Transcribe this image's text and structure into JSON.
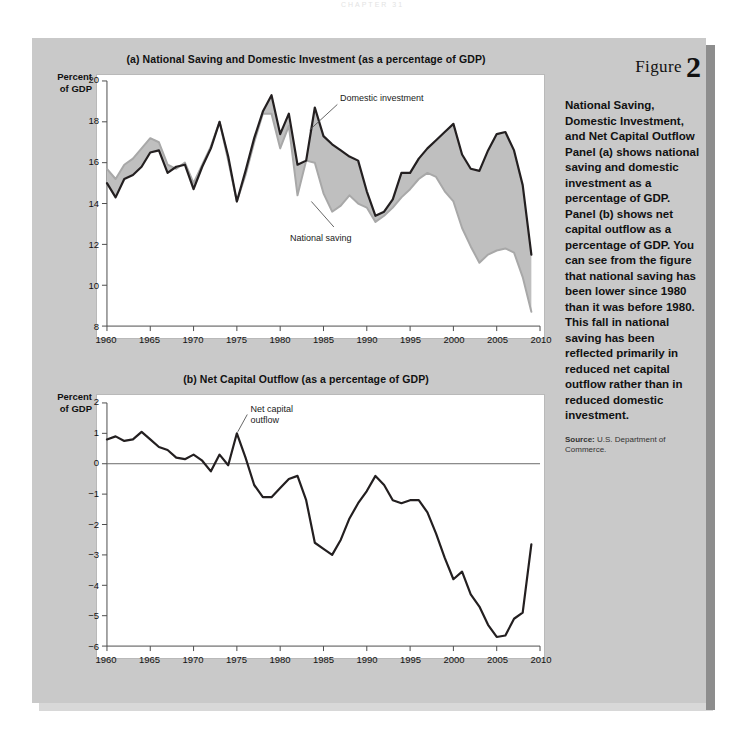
{
  "page_header": "CHAPTER 31",
  "figure": {
    "word": "Figure",
    "number": "2",
    "title": "National Saving, Domestic Investment, and Net Capital Outflow",
    "body": "Panel (a) shows national saving and domestic investment as a percentage of GDP. Panel (b) shows net capital outflow as a percentage of GDP. You can see from the figure that national saving has been lower since 1980 than it was before 1980. This fall in national saving has been reflected primarily in reduced net capital outflow rather than in reduced domestic investment.",
    "source_label": "Source:",
    "source_text": " U.S. Department of Commerce."
  },
  "colors": {
    "page_background": "#ffffff",
    "panel_background": "#c9c9c9",
    "plot_background": "#ffffff",
    "dark_line": "#231f20",
    "gray_line": "#a8a8a8",
    "shaded_area": "#bfbfbf",
    "axis": "#4d4d4d",
    "text": "#111111"
  },
  "chart_data": [
    {
      "type": "line",
      "id": "panel-a",
      "title": "(a) National Saving and Domestic Investment (as a percentage of GDP)",
      "xlabel": "",
      "ylabel": "Percent of GDP",
      "ylabel_lines": [
        "Percent",
        "of GDP"
      ],
      "xlim": [
        1960,
        2010
      ],
      "ylim": [
        8,
        20
      ],
      "yticks": [
        8,
        10,
        12,
        14,
        16,
        18,
        20
      ],
      "xticks": [
        1960,
        1965,
        1970,
        1975,
        1980,
        1985,
        1990,
        1995,
        2000,
        2005,
        2010
      ],
      "grid": false,
      "legend": "inline-annotations",
      "annotations": [
        {
          "text": "Domestic investment",
          "x": 1986,
          "y": 19.2
        },
        {
          "text": "National saving",
          "x": 1984.5,
          "y": 12.4
        }
      ],
      "x": [
        1960,
        1961,
        1962,
        1963,
        1964,
        1965,
        1966,
        1967,
        1968,
        1969,
        1970,
        1971,
        1972,
        1973,
        1974,
        1975,
        1976,
        1977,
        1978,
        1979,
        1980,
        1981,
        1982,
        1983,
        1984,
        1985,
        1986,
        1987,
        1988,
        1989,
        1990,
        1991,
        1992,
        1993,
        1994,
        1995,
        1996,
        1997,
        1998,
        1999,
        2000,
        2001,
        2002,
        2003,
        2004,
        2005,
        2006,
        2007,
        2008,
        2009
      ],
      "series": [
        {
          "name": "Domestic investment",
          "color": "#231f20",
          "values": [
            15.0,
            14.3,
            15.2,
            15.4,
            15.8,
            16.5,
            16.6,
            15.5,
            15.8,
            15.9,
            14.7,
            15.8,
            16.7,
            18.0,
            16.3,
            14.1,
            15.6,
            17.2,
            18.5,
            19.3,
            17.4,
            18.4,
            15.9,
            16.1,
            18.7,
            17.3,
            16.9,
            16.6,
            16.3,
            16.1,
            14.6,
            13.4,
            13.6,
            14.2,
            15.5,
            15.5,
            16.2,
            16.7,
            17.1,
            17.5,
            17.9,
            16.4,
            15.7,
            15.6,
            16.6,
            17.4,
            17.5,
            16.6,
            14.9,
            11.5
          ]
        },
        {
          "name": "National saving",
          "color": "#a8a8a8",
          "values": [
            15.7,
            15.2,
            15.9,
            16.2,
            16.7,
            17.2,
            17.0,
            15.9,
            15.7,
            16.0,
            15.0,
            15.9,
            16.8,
            18.0,
            16.1,
            14.1,
            15.4,
            17.0,
            18.4,
            18.4,
            16.7,
            17.8,
            14.4,
            16.1,
            16.0,
            14.5,
            13.6,
            13.9,
            14.4,
            14.0,
            13.8,
            13.1,
            13.4,
            13.8,
            14.3,
            14.7,
            15.2,
            15.5,
            15.3,
            14.6,
            14.1,
            12.8,
            11.9,
            11.1,
            11.5,
            11.7,
            11.8,
            11.6,
            10.4,
            8.7
          ]
        }
      ]
    },
    {
      "type": "line",
      "id": "panel-b",
      "title": "(b) Net Capital Outflow (as a percentage of GDP)",
      "xlabel": "",
      "ylabel": "Percent of GDP",
      "ylabel_lines": [
        "Percent",
        "of GDP"
      ],
      "xlim": [
        1960,
        2010
      ],
      "ylim": [
        -6,
        2
      ],
      "yticks": [
        -6,
        -5,
        -4,
        -3,
        -2,
        -1,
        0,
        1,
        2
      ],
      "ytick_labels": [
        "−6",
        "−5",
        "−4",
        "−3",
        "−2",
        "−1",
        "0",
        "1",
        "2"
      ],
      "xticks": [
        1960,
        1965,
        1970,
        1975,
        1980,
        1985,
        1990,
        1995,
        2000,
        2005,
        2010
      ],
      "grid": false,
      "zero_line": true,
      "annotations": [
        {
          "text": "Net capital\noutflow",
          "x": 1977,
          "y": 1.8
        }
      ],
      "x": [
        1960,
        1961,
        1962,
        1963,
        1964,
        1965,
        1966,
        1967,
        1968,
        1969,
        1970,
        1971,
        1972,
        1973,
        1974,
        1975,
        1976,
        1977,
        1978,
        1979,
        1980,
        1981,
        1982,
        1983,
        1984,
        1985,
        1986,
        1987,
        1988,
        1989,
        1990,
        1991,
        1992,
        1993,
        1994,
        1995,
        1996,
        1997,
        1998,
        1999,
        2000,
        2001,
        2002,
        2003,
        2004,
        2005,
        2006,
        2007,
        2008,
        2009
      ],
      "series": [
        {
          "name": "Net capital outflow",
          "color": "#231f20",
          "values": [
            0.8,
            0.9,
            0.75,
            0.8,
            1.05,
            0.8,
            0.55,
            0.45,
            0.2,
            0.15,
            0.3,
            0.1,
            -0.25,
            0.3,
            -0.05,
            1.0,
            0.2,
            -0.7,
            -1.1,
            -1.1,
            -0.8,
            -0.5,
            -0.4,
            -1.2,
            -2.6,
            -2.8,
            -3.0,
            -2.5,
            -1.8,
            -1.3,
            -0.9,
            -0.4,
            -0.7,
            -1.2,
            -1.3,
            -1.2,
            -1.2,
            -1.6,
            -2.3,
            -3.1,
            -3.8,
            -3.55,
            -4.3,
            -4.7,
            -5.3,
            -5.7,
            -5.65,
            -5.1,
            -4.9,
            -2.65
          ]
        }
      ]
    }
  ]
}
